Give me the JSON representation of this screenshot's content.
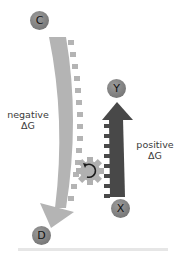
{
  "diagram": {
    "nodes": {
      "C": {
        "label": "C",
        "role": "start of favorable reaction"
      },
      "D": {
        "label": "D",
        "role": "end of favorable reaction"
      },
      "X": {
        "label": "X",
        "role": "start of unfavorable reaction"
      },
      "Y": {
        "label": "Y",
        "role": "end of unfavorable reaction"
      }
    },
    "labels": {
      "negative": {
        "line1": "negative",
        "line2": "ΔG"
      },
      "positive": {
        "line1": "positive",
        "line2": "ΔG"
      }
    },
    "arrows": [
      {
        "from": "C",
        "to": "D",
        "direction": "down",
        "color": "#b4b4b4",
        "meaning": "negative ΔG"
      },
      {
        "from": "X",
        "to": "Y",
        "direction": "up",
        "color": "#4a4a4a",
        "meaning": "positive ΔG"
      }
    ],
    "coupling": {
      "icon": "gear",
      "glyph": "↻",
      "color": "#b0b0b0"
    },
    "colors": {
      "light_arrow": "#b4b4b4",
      "dark_arrow": "#484848",
      "node_fill": "#858585",
      "gear": "#b0b0b0",
      "baseline": "#e6e6e6"
    }
  }
}
